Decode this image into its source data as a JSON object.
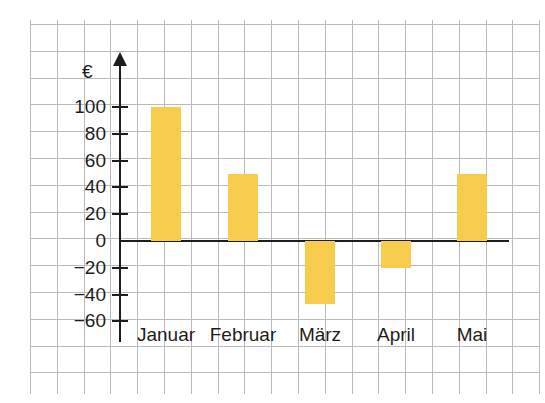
{
  "chart_data": {
    "type": "bar",
    "title": "",
    "xlabel": "",
    "ylabel": "€",
    "unit_symbol": "€",
    "categories": [
      "Januar",
      "Februar",
      "März",
      "April",
      "Mai"
    ],
    "values": [
      100,
      50,
      -47,
      -20,
      50
    ],
    "ylim": [
      -60,
      100
    ],
    "ytick_labels": [
      "100",
      "80",
      "60",
      "40",
      "20",
      "0",
      "−20",
      "−40",
      "−60"
    ],
    "ytick_values": [
      100,
      80,
      60,
      40,
      20,
      0,
      -20,
      -40,
      -60
    ],
    "grid": true,
    "legend": "none",
    "bar_color": "#f8cd4d",
    "axis_color": "#1d1d1b",
    "grid_color": "#b9b9bf",
    "background_color": "#ffffff"
  },
  "axis": {
    "unit": "€",
    "ticks": [
      {
        "label": "100",
        "value": 100
      },
      {
        "label": "80",
        "value": 80
      },
      {
        "label": "60",
        "value": 60
      },
      {
        "label": "40",
        "value": 40
      },
      {
        "label": "20",
        "value": 20
      },
      {
        "label": "0",
        "value": 0
      },
      {
        "label": "−20",
        "value": -20
      },
      {
        "label": "−40",
        "value": -40
      },
      {
        "label": "−60",
        "value": -60
      }
    ]
  },
  "bars": [
    {
      "label": "Januar",
      "value": 100
    },
    {
      "label": "Februar",
      "value": 50
    },
    {
      "label": "März",
      "value": -47
    },
    {
      "label": "April",
      "value": -20
    },
    {
      "label": "Mai",
      "value": 50
    }
  ]
}
